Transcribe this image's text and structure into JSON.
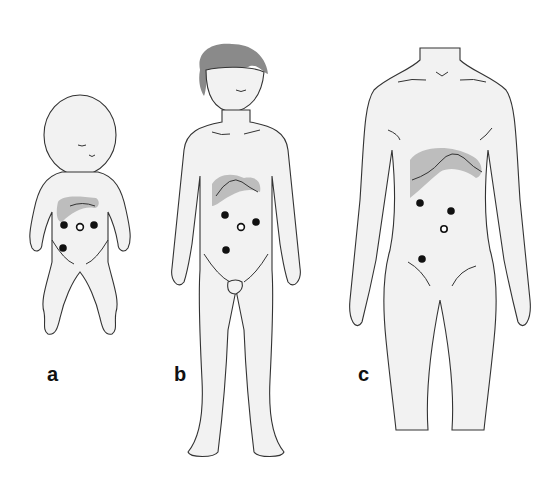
{
  "figure": {
    "panels": [
      {
        "id": "a",
        "label": "a",
        "subject": "infant",
        "ports": {
          "filled": 3,
          "open": 1
        }
      },
      {
        "id": "b",
        "label": "b",
        "subject": "child",
        "ports": {
          "filled": 3,
          "open": 1
        }
      },
      {
        "id": "c",
        "label": "c",
        "subject": "adult",
        "ports": {
          "filled": 3,
          "open": 1
        }
      }
    ],
    "colors": {
      "skin": "#f2f2f2",
      "outline": "#333333",
      "liver": "#bdbdbd",
      "port_filled": "#111111",
      "port_open": "#ffffff",
      "hair": "#8a8a8a"
    }
  }
}
